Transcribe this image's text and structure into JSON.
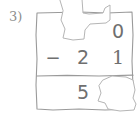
{
  "item": {
    "number_label": "3)"
  },
  "problem": {
    "operator": "−",
    "minuend": {
      "tens": "",
      "ones": "0"
    },
    "subtrahend": {
      "tens": "2",
      "ones": "1"
    },
    "difference": {
      "tens": "5",
      "ones": ""
    }
  },
  "colors": {
    "ink": "#6f6f6f",
    "pencil_line": "#9a9a9a",
    "label": "#8d8d8d",
    "paper": "#ffffff",
    "erasure_fill": "#ffffff",
    "erasure_edge": "#b5b5b5"
  }
}
